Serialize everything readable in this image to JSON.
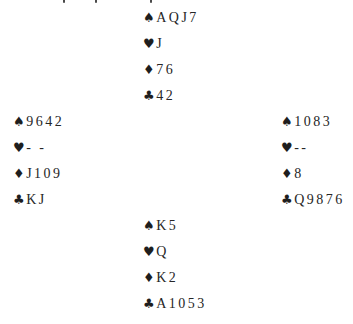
{
  "page": {
    "background": "#ffffff",
    "text_color": "#262626"
  },
  "deal": {
    "north": {
      "suits": [
        {
          "name": "spades",
          "symbol": "♠",
          "cards": "AQJ7"
        },
        {
          "name": "hearts",
          "symbol": "♥",
          "cards": "J"
        },
        {
          "name": "diamonds",
          "symbol": "♦",
          "cards": "76"
        },
        {
          "name": "clubs",
          "symbol": "♣",
          "cards": "42"
        }
      ]
    },
    "west": {
      "suits": [
        {
          "name": "spades",
          "symbol": "♠",
          "cards": "9642"
        },
        {
          "name": "hearts",
          "symbol": "♥",
          "cards": "- -"
        },
        {
          "name": "diamonds",
          "symbol": "♦",
          "cards": "J109"
        },
        {
          "name": "clubs",
          "symbol": "♣",
          "cards": "KJ"
        }
      ]
    },
    "east": {
      "suits": [
        {
          "name": "spades",
          "symbol": "♠",
          "cards": "1083"
        },
        {
          "name": "hearts",
          "symbol": "♥",
          "cards": "--"
        },
        {
          "name": "diamonds",
          "symbol": "♦",
          "cards": "8"
        },
        {
          "name": "clubs",
          "symbol": "♣",
          "cards": "Q9876"
        }
      ]
    },
    "south": {
      "suits": [
        {
          "name": "spades",
          "symbol": "♠",
          "cards": "K5"
        },
        {
          "name": "hearts",
          "symbol": "♥",
          "cards": "Q"
        },
        {
          "name": "diamonds",
          "symbol": "♦",
          "cards": "K2"
        },
        {
          "name": "clubs",
          "symbol": "♣",
          "cards": "A1053"
        }
      ]
    }
  }
}
